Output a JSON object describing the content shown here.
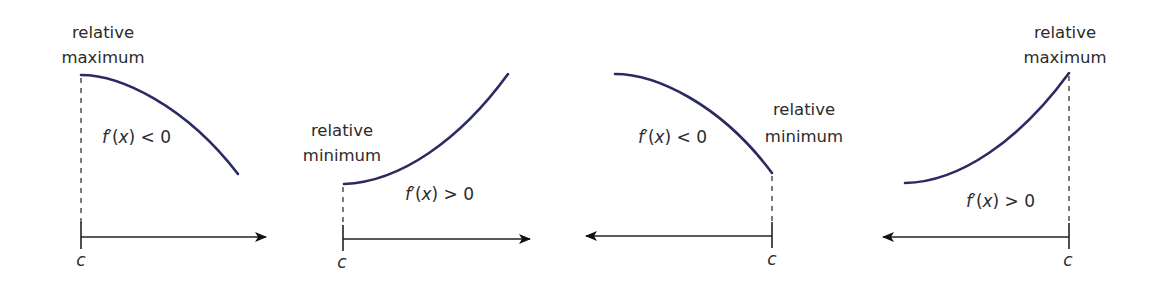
{
  "colors": {
    "curve": "#2b2b63",
    "text": "#2b2b2b",
    "axis": "#222222",
    "background": "#ffffff"
  },
  "panels": [
    {
      "id": "panel-1",
      "extremum_label_line1": "relative",
      "extremum_label_line2": "maximum",
      "derivative_fn": "f",
      "derivative_prime": "′",
      "derivative_arg": "(",
      "derivative_var": "x",
      "derivative_close": ")",
      "derivative_rel": " < 0",
      "point_label": "c",
      "curve_shape": "decreasing, concave down",
      "axis_direction": "right"
    },
    {
      "id": "panel-2",
      "extremum_label_line1": "relative",
      "extremum_label_line2": "minimum",
      "derivative_fn": "f",
      "derivative_prime": "′",
      "derivative_arg": "(",
      "derivative_var": "x",
      "derivative_close": ")",
      "derivative_rel": " > 0",
      "point_label": "c",
      "curve_shape": "increasing, concave up",
      "axis_direction": "right"
    },
    {
      "id": "panel-3",
      "extremum_label_line1": "relative",
      "extremum_label_line2": "minimum",
      "derivative_fn": "f",
      "derivative_prime": "′",
      "derivative_arg": "(",
      "derivative_var": "x",
      "derivative_close": ")",
      "derivative_rel": " < 0",
      "point_label": "c",
      "curve_shape": "decreasing, concave down",
      "axis_direction": "left"
    },
    {
      "id": "panel-4",
      "extremum_label_line1": "relative",
      "extremum_label_line2": "maximum",
      "derivative_fn": "f",
      "derivative_prime": "′",
      "derivative_arg": "(",
      "derivative_var": "x",
      "derivative_close": ")",
      "derivative_rel": " > 0",
      "point_label": "c",
      "curve_shape": "increasing, concave up",
      "axis_direction": "left"
    }
  ]
}
